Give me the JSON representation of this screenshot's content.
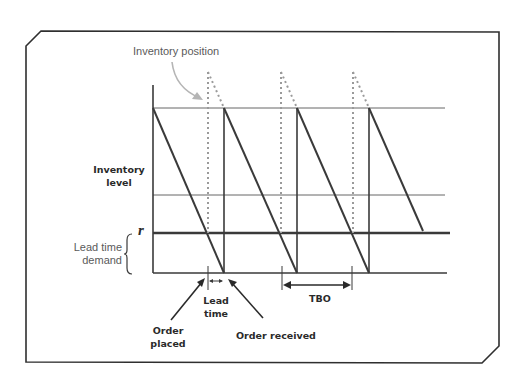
{
  "diagram": {
    "type": "inventory-sawtooth",
    "labels": {
      "inventory_position": "Inventory position",
      "inventory_level_line1": "Inventory",
      "inventory_level_line2": "level",
      "reorder_point": "r",
      "lead_time_demand_line1": "Lead time",
      "lead_time_demand_line2": "demand",
      "lead_time_line1": "Lead",
      "lead_time_line2": "time",
      "order_placed_line1": "Order",
      "order_placed_line2": "placed",
      "order_received": "Order received",
      "tbo": "TBO"
    },
    "colors": {
      "frame": "#2f2f2f",
      "sawtooth": "#3a3a3a",
      "dotted": "#9a9a9a",
      "arrow_light": "#b5b5b5",
      "grid_line": "#555555"
    },
    "cycles": 4,
    "levels": [
      "max (Q + r)",
      "middle",
      "reorder point r",
      "zero"
    ]
  }
}
